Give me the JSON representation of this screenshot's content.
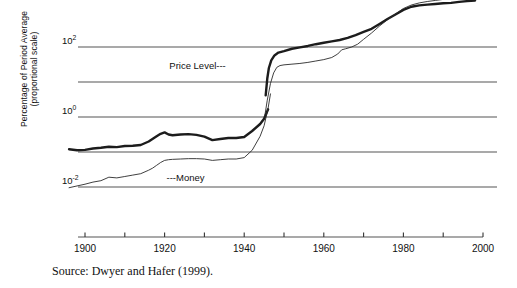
{
  "figure": {
    "source_note": "Source: Dwyer and Hafer (1999).",
    "axis_title_line1": "Percentage of Period Average",
    "axis_title_line2": "(proportional scale)"
  },
  "chart_data": {
    "type": "line",
    "title": "",
    "xlabel": "",
    "ylabel": "Percentage of Period Average (proportional scale)",
    "scale": "log",
    "grid": true,
    "legend": "inline-annotations",
    "xlim": [
      1895,
      1999
    ],
    "xticks_major": [
      1900,
      1920,
      1940,
      1960,
      1980,
      2000
    ],
    "xticks_minor": [
      1910,
      1930,
      1950,
      1970,
      1990
    ],
    "xtick_labels": [
      "1900",
      "1920",
      "1940",
      "1960",
      "1980",
      "2000"
    ],
    "ylim_exponent": [
      -3,
      4
    ],
    "yticks": [
      100,
      1,
      0.01
    ],
    "ytick_labels": [
      "10",
      "10",
      "10"
    ],
    "ytick_exponents": [
      "2",
      "0",
      "-2"
    ],
    "gridline_exponents": [
      4,
      2,
      1,
      0,
      -1,
      -2
    ],
    "annotations": [
      {
        "text": "Price Level",
        "dash": "---",
        "x": 1935,
        "y_exponent": 1.45
      },
      {
        "text": "Money",
        "dash": "---",
        "x": 1922,
        "y_exponent": -1.75
      }
    ],
    "series": [
      {
        "name": "Price Level",
        "style": "thick",
        "color": "#1c1c1c",
        "width": 2.4,
        "segments": [
          {
            "label": "pre-war-price-level",
            "points": [
              [
                1896,
                -0.92
              ],
              [
                1898,
                -0.95
              ],
              [
                1900,
                -0.94
              ],
              [
                1902,
                -0.9
              ],
              [
                1904,
                -0.88
              ],
              [
                1906,
                -0.85
              ],
              [
                1908,
                -0.86
              ],
              [
                1910,
                -0.83
              ],
              [
                1912,
                -0.82
              ],
              [
                1914,
                -0.8
              ],
              [
                1916,
                -0.7
              ],
              [
                1918,
                -0.55
              ],
              [
                1919,
                -0.48
              ],
              [
                1920,
                -0.44
              ],
              [
                1921,
                -0.5
              ],
              [
                1922,
                -0.52
              ],
              [
                1924,
                -0.5
              ],
              [
                1926,
                -0.49
              ],
              [
                1928,
                -0.51
              ],
              [
                1930,
                -0.56
              ],
              [
                1932,
                -0.66
              ],
              [
                1934,
                -0.63
              ],
              [
                1936,
                -0.6
              ],
              [
                1938,
                -0.6
              ],
              [
                1940,
                -0.57
              ],
              [
                1942,
                -0.4
              ],
              [
                1944,
                -0.2
              ],
              [
                1945,
                -0.05
              ],
              [
                1946,
                0.22
              ]
            ]
          },
          {
            "label": "post-war-price-level",
            "points": [
              [
                1945.4,
                0.62
              ],
              [
                1945.8,
                1.1
              ],
              [
                1946.2,
                1.4
              ],
              [
                1946.8,
                1.62
              ],
              [
                1947.6,
                1.76
              ],
              [
                1948.6,
                1.84
              ],
              [
                1950,
                1.88
              ],
              [
                1952,
                1.95
              ],
              [
                1954,
                1.99
              ],
              [
                1956,
                2.03
              ],
              [
                1958,
                2.08
              ],
              [
                1960,
                2.12
              ],
              [
                1962,
                2.16
              ],
              [
                1964,
                2.2
              ],
              [
                1966,
                2.26
              ],
              [
                1968,
                2.34
              ],
              [
                1970,
                2.43
              ],
              [
                1972,
                2.52
              ],
              [
                1974,
                2.66
              ],
              [
                1976,
                2.8
              ],
              [
                1978,
                2.93
              ],
              [
                1980,
                3.06
              ],
              [
                1982,
                3.15
              ],
              [
                1984,
                3.19
              ],
              [
                1986,
                3.21
              ],
              [
                1988,
                3.23
              ],
              [
                1990,
                3.25
              ],
              [
                1992,
                3.26
              ],
              [
                1994,
                3.29
              ],
              [
                1996,
                3.31
              ],
              [
                1998,
                3.33
              ]
            ]
          }
        ]
      },
      {
        "name": "Money",
        "style": "thin",
        "color": "#2a2a2a",
        "width": 0.9,
        "segments": [
          {
            "label": "pre-war-money",
            "points": [
              [
                1896,
                -2.02
              ],
              [
                1898,
                -1.97
              ],
              [
                1900,
                -1.92
              ],
              [
                1902,
                -1.86
              ],
              [
                1904,
                -1.82
              ],
              [
                1906,
                -1.72
              ],
              [
                1908,
                -1.74
              ],
              [
                1910,
                -1.7
              ],
              [
                1912,
                -1.66
              ],
              [
                1914,
                -1.62
              ],
              [
                1916,
                -1.52
              ],
              [
                1917,
                -1.46
              ],
              [
                1918,
                -1.38
              ],
              [
                1919,
                -1.3
              ],
              [
                1920,
                -1.24
              ],
              [
                1921,
                -1.22
              ],
              [
                1922,
                -1.21
              ],
              [
                1924,
                -1.2
              ],
              [
                1926,
                -1.19
              ],
              [
                1928,
                -1.19
              ],
              [
                1930,
                -1.2
              ],
              [
                1932,
                -1.24
              ],
              [
                1934,
                -1.22
              ],
              [
                1936,
                -1.2
              ],
              [
                1938,
                -1.2
              ],
              [
                1940,
                -1.16
              ],
              [
                1942,
                -0.95
              ],
              [
                1944,
                -0.55
              ],
              [
                1945,
                -0.25
              ],
              [
                1946,
                0.25
              ],
              [
                1946.6,
                0.66
              ]
            ]
          },
          {
            "label": "post-war-money",
            "points": [
              [
                1945.2,
                0.05
              ],
              [
                1945.8,
                0.48
              ],
              [
                1946.6,
                0.96
              ],
              [
                1947.4,
                1.26
              ],
              [
                1948.2,
                1.42
              ],
              [
                1949,
                1.47
              ],
              [
                1950,
                1.49
              ],
              [
                1952,
                1.51
              ],
              [
                1954,
                1.53
              ],
              [
                1956,
                1.56
              ],
              [
                1958,
                1.6
              ],
              [
                1960,
                1.64
              ],
              [
                1962,
                1.7
              ],
              [
                1963.5,
                1.8
              ],
              [
                1964.5,
                1.92
              ],
              [
                1965.5,
                1.95
              ],
              [
                1967,
                2.0
              ],
              [
                1968.5,
                2.08
              ],
              [
                1970,
                2.22
              ],
              [
                1972,
                2.4
              ],
              [
                1974,
                2.6
              ],
              [
                1976,
                2.78
              ],
              [
                1978,
                2.94
              ],
              [
                1980,
                3.1
              ],
              [
                1982,
                3.2
              ],
              [
                1984,
                3.26
              ],
              [
                1986,
                3.3
              ],
              [
                1988,
                3.33
              ],
              [
                1990,
                3.36
              ],
              [
                1992,
                3.38
              ],
              [
                1994,
                3.4
              ],
              [
                1996,
                3.42
              ],
              [
                1998,
                3.4
              ]
            ]
          }
        ]
      }
    ]
  }
}
